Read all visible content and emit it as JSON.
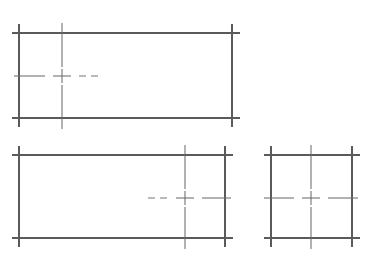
{
  "sheet": {
    "title": "Orthographic Projection Line Drawing",
    "width": 374,
    "height": 270,
    "background_color": "#ffffff",
    "line_color": "#5a5a5a",
    "center_line_color": "#6b6b6b"
  },
  "views": [
    {
      "id": "view-top-left",
      "name": "upper-left-rectangle-view",
      "label": "Upper left elevation view",
      "rect": {
        "left": 19,
        "right": 232,
        "top": 33,
        "bottom": 118,
        "width": 213,
        "height": 85
      },
      "overrun": 9,
      "center_mark": {
        "x": 62,
        "y": 76
      },
      "center_vertical_x": 62,
      "center_horizontal_y": 76,
      "horizontal_dash_end_x": 98,
      "horizontal_dash_start_x": 14
    },
    {
      "id": "view-bottom-left",
      "name": "lower-left-rectangle-view",
      "label": "Lower left plan view",
      "rect": {
        "left": 19,
        "right": 225,
        "top": 155,
        "bottom": 238,
        "width": 206,
        "height": 83
      },
      "overrun": 9,
      "center_mark": {
        "x": 185,
        "y": 198
      },
      "center_vertical_x": 185,
      "center_horizontal_y": 198,
      "horizontal_dash_start_x": 148,
      "horizontal_dash_end_x": 231
    },
    {
      "id": "view-bottom-right",
      "name": "lower-right-rectangle-view",
      "label": "Lower right side view",
      "rect": {
        "left": 271,
        "right": 352,
        "top": 155,
        "bottom": 238,
        "width": 81,
        "height": 83
      },
      "overrun": 9,
      "center_mark": {
        "x": 311,
        "y": 198
      },
      "center_vertical_x": 311,
      "center_horizontal_y": 198,
      "horizontal_dash_start_x": 264,
      "horizontal_dash_end_x": 358
    }
  ],
  "legend": {
    "solid_line_meaning": "visible edge / object line",
    "dashed_line_meaning": "center line / axis"
  }
}
